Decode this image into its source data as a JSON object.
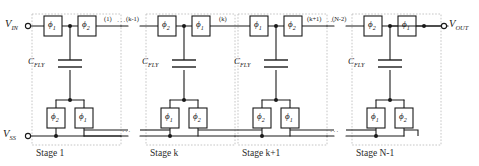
{
  "figure": {
    "type": "schematic",
    "background": "#ffffff",
    "line_color": "#1a1a1a",
    "dashed_box_color": "#bdbdbd"
  },
  "terminals": {
    "input": {
      "label": "V",
      "sub": "IN"
    },
    "output": {
      "label": "V",
      "sub": "OUT"
    },
    "ground": {
      "label": "V",
      "sub": "SS"
    }
  },
  "capacitor": {
    "label": "C",
    "sub": "FLY"
  },
  "phase": {
    "phi1": "ϕ",
    "phi1_sub": "1",
    "phi2": "ϕ",
    "phi2_sub": "2"
  },
  "ellipsis": "···",
  "node_labels": [
    {
      "text": "(1)",
      "x": 106,
      "y": 16
    },
    {
      "text": "(k-1)",
      "x": 133,
      "y": 16
    },
    {
      "text": "(k)",
      "x": 222,
      "y": 16
    },
    {
      "text": "(k+1)",
      "x": 311,
      "y": 16
    },
    {
      "text": "(N-2)",
      "x": 339,
      "y": 16
    }
  ],
  "stages": [
    {
      "caption": "Stage 1",
      "top_switches": [
        "ϕ1",
        "ϕ2"
      ],
      "bottom_switches": [
        "ϕ2",
        "ϕ1"
      ],
      "cap_label": "CFLY"
    },
    {
      "caption": "Stage k",
      "top_switches": [
        "ϕ2",
        "ϕ1"
      ],
      "bottom_switches": [
        "ϕ1",
        "ϕ2"
      ],
      "cap_label": "CFLY"
    },
    {
      "caption": "Stage k+1",
      "top_switches": [
        "ϕ1",
        "ϕ2"
      ],
      "bottom_switches": [
        "ϕ2",
        "ϕ1"
      ],
      "cap_label": "CFLY"
    },
    {
      "caption": "Stage N-1",
      "top_switches": [
        "ϕ2",
        "ϕ1"
      ],
      "bottom_switches": [
        "ϕ1",
        "ϕ2"
      ],
      "cap_label": "CFLY"
    }
  ],
  "stage_captions": {
    "s1": "Stage 1",
    "s2": "Stage k",
    "s3": "Stage k+1",
    "s4": "Stage N-1"
  },
  "switch_labels": {
    "s1_top_left": "1",
    "s1_top_right": "2",
    "s1_bot_left": "2",
    "s1_bot_right": "1",
    "s2_top_left": "2",
    "s2_top_right": "1",
    "s2_bot_left": "1",
    "s2_bot_right": "2",
    "s3_top_left": "1",
    "s3_top_right": "2",
    "s3_bot_left": "2",
    "s3_bot_right": "1",
    "s4_top_left": "2",
    "s4_top_right": "1",
    "s4_bot_left": "1",
    "s4_bot_right": "2"
  },
  "node_text": {
    "n1": "(1)",
    "n2": "(k-1)",
    "n3": "(k)",
    "n4": "(k+1)",
    "n5": "(N-2)"
  },
  "dots": {
    "top_left": "···",
    "top_right": "···",
    "bottom_left": "···",
    "bottom_right": "···"
  }
}
